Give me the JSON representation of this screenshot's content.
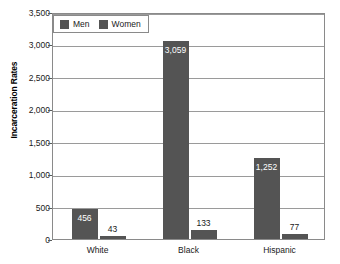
{
  "chart_data": {
    "type": "bar",
    "title": "",
    "subtitle": "",
    "xlabel": "",
    "ylabel": "Incarceration Rates",
    "categories": [
      "White",
      "Black",
      "Hispanic"
    ],
    "series": [
      {
        "name": "Men",
        "values": [
          456,
          3059,
          1252
        ],
        "color": "#545454"
      },
      {
        "name": "Women",
        "values": [
          43,
          133,
          77
        ],
        "color": "#545454"
      }
    ],
    "data_labels": [
      [
        "456",
        "43"
      ],
      [
        "3,059",
        "133"
      ],
      [
        "1,252",
        "77"
      ]
    ],
    "ylim": [
      0,
      3500
    ],
    "ytick_values": [
      0,
      500,
      1000,
      1500,
      2000,
      2500,
      3000,
      3500
    ],
    "ytick_labels": [
      "0",
      "500",
      "1,000",
      "1,500",
      "2,000",
      "2,500",
      "3,000",
      "3,500"
    ],
    "grid": true,
    "grid_axis": "y",
    "legend": {
      "position": "top-left",
      "entries": [
        "Men",
        "Women"
      ]
    },
    "colors": {
      "bar": "#545454",
      "grid": "#9a9a9a",
      "frame": "#8a8a8a",
      "text": "#1a1a1a",
      "inside_label": "#ffffff",
      "background": "#ffffff"
    }
  }
}
